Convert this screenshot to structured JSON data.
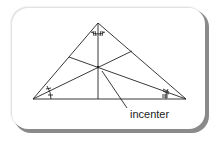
{
  "diagram": {
    "label": "incenter",
    "vertices": {
      "apex": [
        98,
        23
      ],
      "left": [
        33,
        99
      ],
      "right": [
        186,
        99
      ]
    },
    "incenter": [
      98,
      67
    ],
    "colors": {
      "lines": "#222222",
      "frame_shadow": "#8a8a8a",
      "background": "#ffffff"
    }
  }
}
